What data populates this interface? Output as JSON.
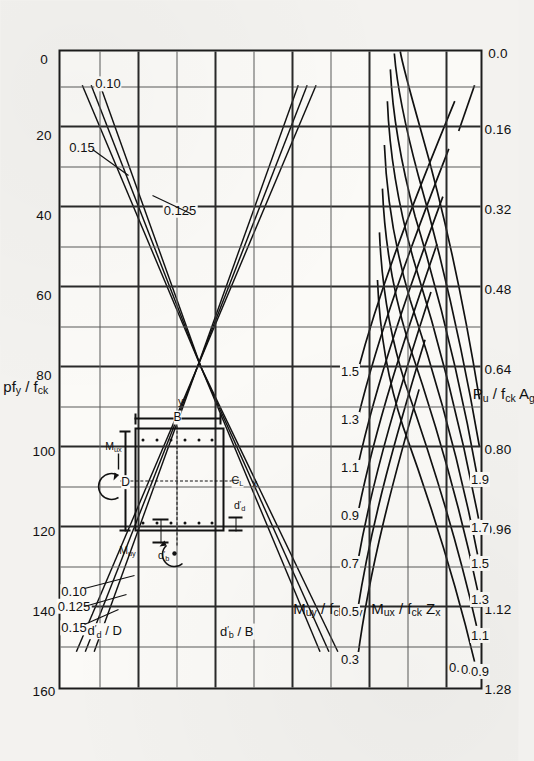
{
  "figure": {
    "title_hidden": "",
    "top_axis": {
      "label": "p f y / f ck",
      "label_parts": {
        "p": "p",
        "f": "f",
        "y": "y",
        "slash": "/",
        "fck_f": "f",
        "fck": "ck"
      },
      "ticks": [
        "160",
        "140",
        "120",
        "100",
        "80",
        "60",
        "40",
        "20",
        "0"
      ],
      "range": [
        160,
        0
      ]
    },
    "bottom_axis": {
      "label": "P u / f ck A g",
      "ticks": [
        "1.28",
        "1.12",
        "0.96",
        "0.80",
        "0.64",
        "0.48",
        "0.32",
        "0.16",
        "0.0"
      ],
      "range": [
        1.28,
        0.0
      ]
    },
    "left_axis_labels": [
      "M uy / f ck Z y",
      "M ux / f ck Z x"
    ],
    "ratio_labels": {
      "dd_over_D": "d'd / D",
      "db_over_B": "d'b / B",
      "dd_values": [
        "0.15",
        "0.125",
        "0.10"
      ],
      "db_values": [
        "0.15",
        "0.125",
        "0.10"
      ]
    },
    "curve_labels_muy": [
      "0.3",
      "0.5",
      "0.7",
      "0.9",
      "1.1",
      "1.3",
      "1.5"
    ],
    "curve_labels_mux": [
      "0.3",
      "0.7",
      "0.9",
      "1.1",
      "1.3",
      "1.5",
      "1.7",
      "1.9"
    ],
    "inset": {
      "caption_D": "D",
      "caption_B": "B",
      "caption_Mux": "M ux",
      "caption_Muy": "M uy",
      "caption_ddash_b": "d'b",
      "caption_ddash_d": "d'd",
      "caption_x": "x",
      "caption_y": "y",
      "caption_centerline": "C L"
    },
    "colors": {
      "ink": "#111111",
      "grid": "#5a5a5a",
      "paper": "#f3f2ef",
      "plot_bg": "#fbfaf7"
    }
  },
  "chart_data": {
    "type": "line",
    "xlabel": "P u / f ck A g",
    "ylabel": "p f y / f ck",
    "xlim": [
      0.0,
      1.28
    ],
    "ylim": [
      0,
      160
    ],
    "grid": true,
    "legend": "inline curve labels",
    "top_axis_label": "pf_y/f_ck",
    "top_axis_ticks": [
      160,
      140,
      120,
      100,
      80,
      60,
      40,
      20,
      0
    ],
    "bottom_axis_label": "P_u/f_ck·A_g",
    "bottom_axis_ticks": [
      1.28,
      1.12,
      0.96,
      0.8,
      0.64,
      0.48,
      0.32,
      0.16,
      0.0
    ],
    "secondary_axis_labels": [
      "M_uy/f_ck·Z_y",
      "M_ux/f_ck·Z_x"
    ],
    "parameter_sets": [
      {
        "name": "d'_d/D",
        "values": [
          0.15,
          0.125,
          0.1
        ]
      },
      {
        "name": "d'_b/B",
        "values": [
          0.15,
          0.125,
          0.1
        ]
      }
    ],
    "series": [
      {
        "name": "M_uy/f_ck Z_y = 0.3",
        "group": "Muy",
        "value": 0.3
      },
      {
        "name": "M_uy/f_ck Z_y = 0.5",
        "group": "Muy",
        "value": 0.5
      },
      {
        "name": "M_uy/f_ck Z_y = 0.7",
        "group": "Muy",
        "value": 0.7
      },
      {
        "name": "M_uy/f_ck Z_y = 0.9",
        "group": "Muy",
        "value": 0.9
      },
      {
        "name": "M_uy/f_ck Z_y = 1.1",
        "group": "Muy",
        "value": 1.1
      },
      {
        "name": "M_uy/f_ck Z_y = 1.3",
        "group": "Muy",
        "value": 1.3
      },
      {
        "name": "M_uy/f_ck Z_y = 1.5",
        "group": "Muy",
        "value": 1.5
      },
      {
        "name": "M_ux/f_ck Z_x = 0.3",
        "group": "Mux",
        "value": 0.3
      },
      {
        "name": "M_ux/f_ck Z_x = 0.7",
        "group": "Mux",
        "value": 0.7
      },
      {
        "name": "M_ux/f_ck Z_x = 0.9",
        "group": "Mux",
        "value": 0.9
      },
      {
        "name": "M_ux/f_ck Z_x = 1.1",
        "group": "Mux",
        "value": 1.1
      },
      {
        "name": "M_ux/f_ck Z_x = 1.3",
        "group": "Mux",
        "value": 1.3
      },
      {
        "name": "M_ux/f_ck Z_x = 1.5",
        "group": "Mux",
        "value": 1.5
      },
      {
        "name": "M_ux/f_ck Z_x = 1.7",
        "group": "Mux",
        "value": 1.7
      },
      {
        "name": "M_ux/f_ck Z_x = 1.9",
        "group": "Mux",
        "value": 1.9
      },
      {
        "name": "d'_d/D = 0.15 (rising)",
        "group": "dd",
        "value": 0.15
      },
      {
        "name": "d'_d/D = 0.125 (rising)",
        "group": "dd",
        "value": 0.125
      },
      {
        "name": "d'_d/D = 0.10 (rising)",
        "group": "dd",
        "value": 0.1
      },
      {
        "name": "d'_b/B = 0.15 (falling)",
        "group": "db",
        "value": 0.15
      },
      {
        "name": "d'_b/B = 0.125 (falling)",
        "group": "db",
        "value": 0.125
      },
      {
        "name": "d'_b/B = 0.10 (falling)",
        "group": "db",
        "value": 0.1
      }
    ]
  }
}
